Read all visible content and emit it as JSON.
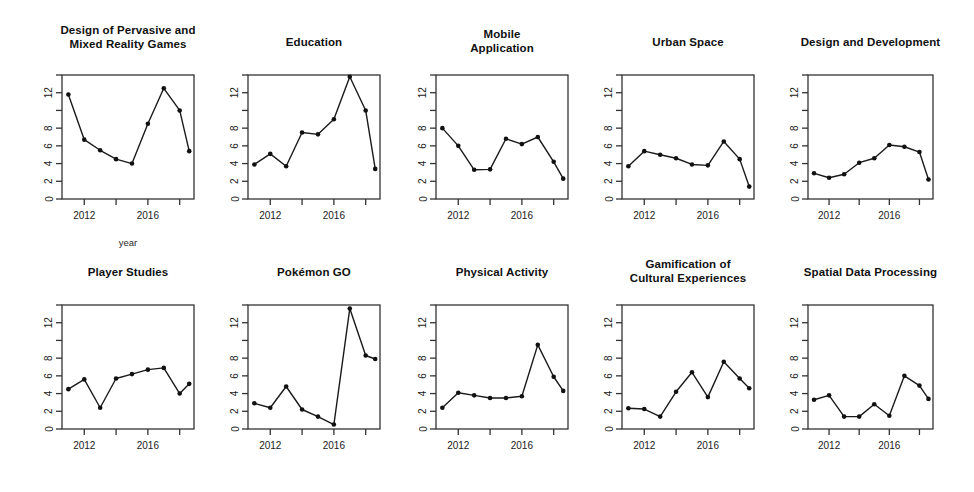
{
  "figure": {
    "background": "#ffffff",
    "line_color": "#1a1a1a",
    "point_color": "#111111",
    "axis_color": "#333333",
    "x_axis_label": "year",
    "y_tick_labels": [
      "0",
      "2",
      "4",
      "6",
      "8",
      "",
      "12",
      ""
    ],
    "y_tick_values": [
      0,
      2,
      4,
      6,
      8,
      10,
      12,
      14
    ],
    "x_tick_labels": [
      "2012",
      "",
      "2016",
      ""
    ],
    "x_tick_values": [
      2012,
      2014,
      2016,
      2018
    ]
  },
  "chart_data": [
    {
      "type": "line",
      "title": "Design of Pervasive and\nMixed Reality Games",
      "xlabel": "year",
      "ylabel": "",
      "xlim": [
        2010.6,
        2018.9
      ],
      "ylim": [
        0,
        14
      ],
      "x": [
        2011,
        2012,
        2013,
        2014,
        2015,
        2016,
        2017,
        2018,
        2018.6
      ],
      "values": [
        11.8,
        6.7,
        5.5,
        4.5,
        4.0,
        8.5,
        12.5,
        10.0,
        5.4
      ],
      "grid": false,
      "legend": "none"
    },
    {
      "type": "line",
      "title": "Education",
      "xlabel": "",
      "ylabel": "",
      "xlim": [
        2010.6,
        2018.9
      ],
      "ylim": [
        0,
        14
      ],
      "x": [
        2011,
        2012,
        2013,
        2014,
        2015,
        2016,
        2017,
        2018,
        2018.6
      ],
      "values": [
        3.9,
        5.1,
        3.7,
        7.5,
        7.3,
        9.0,
        13.8,
        10.0,
        3.4
      ],
      "grid": false,
      "legend": "none"
    },
    {
      "type": "line",
      "title": "Mobile\nApplication",
      "xlabel": "",
      "ylabel": "",
      "xlim": [
        2010.6,
        2018.9
      ],
      "ylim": [
        0,
        14
      ],
      "x": [
        2011,
        2012,
        2013,
        2014,
        2015,
        2016,
        2017,
        2018,
        2018.6
      ],
      "values": [
        8.0,
        6.0,
        3.3,
        3.35,
        6.8,
        6.2,
        7.0,
        4.2,
        2.3
      ],
      "grid": false,
      "legend": "none"
    },
    {
      "type": "line",
      "title": "Urban Space",
      "xlabel": "",
      "ylabel": "",
      "xlim": [
        2010.6,
        2018.9
      ],
      "ylim": [
        0,
        14
      ],
      "x": [
        2011,
        2012,
        2013,
        2014,
        2015,
        2016,
        2017,
        2018,
        2018.6
      ],
      "values": [
        3.7,
        5.4,
        5.0,
        4.6,
        3.9,
        3.8,
        6.5,
        4.5,
        1.4
      ],
      "grid": false,
      "legend": "none"
    },
    {
      "type": "line",
      "title": "Design and Development",
      "xlabel": "",
      "ylabel": "",
      "xlim": [
        2010.6,
        2018.9
      ],
      "ylim": [
        0,
        14
      ],
      "x": [
        2011,
        2012,
        2013,
        2014,
        2015,
        2016,
        2017,
        2018,
        2018.6
      ],
      "values": [
        2.9,
        2.4,
        2.8,
        4.1,
        4.6,
        6.1,
        5.9,
        5.3,
        2.2
      ],
      "grid": false,
      "legend": "none"
    },
    {
      "type": "line",
      "title": "Player Studies",
      "xlabel": "",
      "ylabel": "",
      "xlim": [
        2010.6,
        2018.9
      ],
      "ylim": [
        0,
        14
      ],
      "x": [
        2011,
        2012,
        2013,
        2014,
        2015,
        2016,
        2017,
        2018,
        2018.6
      ],
      "values": [
        4.5,
        5.6,
        2.4,
        5.7,
        6.2,
        6.7,
        6.9,
        4.0,
        5.1
      ],
      "grid": false,
      "legend": "none"
    },
    {
      "type": "line",
      "title": "Pokémon GO",
      "xlabel": "",
      "ylabel": "",
      "xlim": [
        2010.6,
        2018.9
      ],
      "ylim": [
        0,
        14
      ],
      "x": [
        2011,
        2012,
        2013,
        2014,
        2015,
        2016,
        2017,
        2018,
        2018.6
      ],
      "values": [
        2.9,
        2.4,
        4.8,
        2.2,
        1.4,
        0.5,
        13.6,
        8.3,
        7.9
      ],
      "grid": false,
      "legend": "none"
    },
    {
      "type": "line",
      "title": "Physical Activity",
      "xlabel": "",
      "ylabel": "",
      "xlim": [
        2010.6,
        2018.9
      ],
      "ylim": [
        0,
        14
      ],
      "x": [
        2011,
        2012,
        2013,
        2014,
        2015,
        2016,
        2017,
        2018,
        2018.6
      ],
      "values": [
        2.4,
        4.1,
        3.8,
        3.5,
        3.5,
        3.7,
        9.5,
        5.9,
        4.3
      ],
      "grid": false,
      "legend": "none"
    },
    {
      "type": "line",
      "title": "Gamification of\nCultural Experiences",
      "xlabel": "",
      "ylabel": "",
      "xlim": [
        2010.6,
        2018.9
      ],
      "ylim": [
        0,
        14
      ],
      "x": [
        2011,
        2012,
        2013,
        2014,
        2015,
        2016,
        2017,
        2018,
        2018.6
      ],
      "values": [
        2.35,
        2.25,
        1.4,
        4.2,
        6.4,
        3.6,
        7.6,
        5.7,
        4.6
      ],
      "grid": false,
      "legend": "none"
    },
    {
      "type": "line",
      "title": "Spatial Data Processing",
      "xlabel": "",
      "ylabel": "",
      "xlim": [
        2010.6,
        2018.9
      ],
      "ylim": [
        0,
        14
      ],
      "x": [
        2011,
        2012,
        2013,
        2014,
        2015,
        2016,
        2017,
        2018,
        2018.6
      ],
      "values": [
        3.3,
        3.8,
        1.4,
        1.4,
        2.8,
        1.5,
        6.0,
        4.9,
        3.4
      ],
      "grid": false,
      "legend": "none"
    }
  ],
  "layout": {
    "panels": [
      {
        "left": 62,
        "top": 75,
        "width": 132,
        "height": 124,
        "title_top": 24,
        "show_xlabel": true
      },
      {
        "left": 248,
        "top": 75,
        "width": 132,
        "height": 124,
        "title_top": 36,
        "show_xlabel": false
      },
      {
        "left": 436,
        "top": 75,
        "width": 132,
        "height": 124,
        "title_top": 28,
        "show_xlabel": false
      },
      {
        "left": 622,
        "top": 75,
        "width": 132,
        "height": 124,
        "title_top": 36,
        "show_xlabel": false
      },
      {
        "left": 808,
        "top": 75,
        "width": 125,
        "height": 124,
        "title_top": 36,
        "show_xlabel": false
      },
      {
        "left": 62,
        "top": 305,
        "width": 132,
        "height": 124,
        "title_top": 266,
        "show_xlabel": false
      },
      {
        "left": 248,
        "top": 305,
        "width": 132,
        "height": 124,
        "title_top": 266,
        "show_xlabel": false
      },
      {
        "left": 436,
        "top": 305,
        "width": 132,
        "height": 124,
        "title_top": 266,
        "show_xlabel": false
      },
      {
        "left": 622,
        "top": 305,
        "width": 132,
        "height": 124,
        "title_top": 258,
        "show_xlabel": false
      },
      {
        "left": 808,
        "top": 305,
        "width": 125,
        "height": 124,
        "title_top": 266,
        "show_xlabel": false
      }
    ]
  }
}
